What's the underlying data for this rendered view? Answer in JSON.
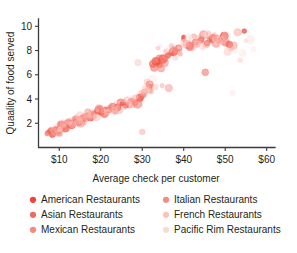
{
  "chart_data": {
    "type": "scatter",
    "title": "",
    "xlabel": "Average check per customer",
    "ylabel": "Quaality of food served",
    "xlim": [
      5,
      62
    ],
    "ylim": [
      0,
      10.6
    ],
    "grid": false,
    "legend_position": "bottom",
    "xticks": [
      10,
      20,
      30,
      40,
      50,
      60
    ],
    "xticklabels": [
      "$10",
      "$20",
      "$30",
      "$40",
      "$50",
      "$60"
    ],
    "yticks": [
      2,
      4,
      6,
      8,
      10
    ],
    "yticklabels": [
      "2",
      "4",
      "6",
      "8",
      "10"
    ],
    "series": [
      {
        "name": "American Restaurants",
        "color": "#f04438",
        "opacity": 0.85,
        "points": [
          [
            7.2,
            1.2
          ],
          [
            7.8,
            1.4
          ],
          [
            8.4,
            1.1
          ],
          [
            9.1,
            1.5
          ],
          [
            9.8,
            1.3
          ],
          [
            10.6,
            1.8
          ],
          [
            11.4,
            1.6
          ],
          [
            12.2,
            2.0
          ],
          [
            13.0,
            1.9
          ],
          [
            13.9,
            2.2
          ],
          [
            14.8,
            2.1
          ],
          [
            15.7,
            2.4
          ],
          [
            16.6,
            2.6
          ],
          [
            17.5,
            2.5
          ],
          [
            18.4,
            2.8
          ],
          [
            19.3,
            3.0
          ],
          [
            20.2,
            2.9
          ],
          [
            21.1,
            3.2
          ],
          [
            22.0,
            3.1
          ],
          [
            23.0,
            3.4
          ],
          [
            24.0,
            3.3
          ],
          [
            25.0,
            3.6
          ],
          [
            26.0,
            3.5
          ],
          [
            27.0,
            3.8
          ],
          [
            28.2,
            3.7
          ],
          [
            29.4,
            4.1
          ],
          [
            30.6,
            4.6
          ],
          [
            31.8,
            5.2
          ],
          [
            32.6,
            6.9
          ],
          [
            33.4,
            7.1
          ],
          [
            34.2,
            6.8
          ],
          [
            35.0,
            7.3
          ],
          [
            36.2,
            7.6
          ],
          [
            37.5,
            7.9
          ],
          [
            38.8,
            8.2
          ],
          [
            40.0,
            9.1
          ],
          [
            41.4,
            8.4
          ],
          [
            42.8,
            8.7
          ],
          [
            44.2,
            8.9
          ],
          [
            45.6,
            8.6
          ],
          [
            47.0,
            9.0
          ],
          [
            48.4,
            8.8
          ],
          [
            49.8,
            9.2
          ],
          [
            51.0,
            8.5
          ],
          [
            54.6,
            9.6
          ]
        ]
      },
      {
        "name": "Asian Restaurants",
        "color": "#f4695e",
        "opacity": 0.7,
        "points": [
          [
            7.5,
            1.3
          ],
          [
            8.2,
            1.0
          ],
          [
            9.0,
            1.4
          ],
          [
            9.9,
            1.2
          ],
          [
            10.9,
            1.7
          ],
          [
            11.9,
            1.9
          ],
          [
            12.9,
            1.8
          ],
          [
            14.0,
            2.3
          ],
          [
            15.1,
            2.0
          ],
          [
            16.2,
            2.5
          ],
          [
            17.3,
            2.7
          ],
          [
            18.5,
            2.6
          ],
          [
            19.7,
            3.1
          ],
          [
            20.9,
            2.8
          ],
          [
            22.2,
            3.3
          ],
          [
            23.5,
            3.0
          ],
          [
            24.8,
            3.7
          ],
          [
            26.1,
            3.4
          ],
          [
            27.5,
            3.9
          ],
          [
            28.9,
            3.6
          ],
          [
            30.3,
            4.3
          ],
          [
            31.7,
            5.0
          ],
          [
            32.9,
            6.6
          ],
          [
            34.1,
            7.4
          ],
          [
            35.3,
            7.0
          ],
          [
            36.8,
            7.8
          ],
          [
            38.3,
            8.0
          ],
          [
            39.9,
            8.9
          ],
          [
            41.5,
            8.3
          ],
          [
            43.1,
            8.6
          ],
          [
            44.8,
            9.3
          ],
          [
            46.5,
            8.9
          ],
          [
            48.2,
            9.1
          ],
          [
            50.0,
            8.7
          ],
          [
            45.2,
            6.2
          ]
        ]
      },
      {
        "name": "Mexican Restaurants",
        "color": "#f6897f",
        "opacity": 0.6,
        "points": [
          [
            7.0,
            1.1
          ],
          [
            8.0,
            1.5
          ],
          [
            9.3,
            1.3
          ],
          [
            10.4,
            1.9
          ],
          [
            11.6,
            1.6
          ],
          [
            12.8,
            2.1
          ],
          [
            14.2,
            2.4
          ],
          [
            15.5,
            2.2
          ],
          [
            16.9,
            2.9
          ],
          [
            18.2,
            2.6
          ],
          [
            19.6,
            3.2
          ],
          [
            21.0,
            2.9
          ],
          [
            22.5,
            3.5
          ],
          [
            24.0,
            3.2
          ],
          [
            25.5,
            3.8
          ],
          [
            27.0,
            3.4
          ],
          [
            28.6,
            4.0
          ],
          [
            30.2,
            4.4
          ],
          [
            31.6,
            4.8
          ],
          [
            33.0,
            7.2
          ],
          [
            34.6,
            6.5
          ],
          [
            36.0,
            7.5
          ],
          [
            37.6,
            8.1
          ],
          [
            39.2,
            7.7
          ],
          [
            40.8,
            8.5
          ],
          [
            42.5,
            9.2
          ],
          [
            44.2,
            8.8
          ],
          [
            46.0,
            9.4
          ],
          [
            47.8,
            8.6
          ],
          [
            49.6,
            9.0
          ],
          [
            34.8,
            5.1
          ],
          [
            36.4,
            4.9
          ],
          [
            52.0,
            8.4
          ]
        ]
      },
      {
        "name": "Italian Restaurants",
        "color": "#f8a49c",
        "opacity": 0.55,
        "points": [
          [
            8.6,
            1.4
          ],
          [
            10.0,
            1.2
          ],
          [
            11.2,
            1.8
          ],
          [
            12.6,
            2.0
          ],
          [
            14.5,
            2.3
          ],
          [
            16.0,
            2.1
          ],
          [
            17.8,
            2.8
          ],
          [
            19.0,
            2.5
          ],
          [
            20.5,
            3.0
          ],
          [
            22.8,
            3.4
          ],
          [
            24.4,
            3.1
          ],
          [
            26.4,
            3.9
          ],
          [
            28.0,
            3.6
          ],
          [
            29.8,
            4.5
          ],
          [
            31.2,
            5.4
          ],
          [
            32.2,
            4.6
          ],
          [
            33.8,
            8.2
          ],
          [
            35.6,
            7.9
          ],
          [
            37.0,
            8.4
          ],
          [
            38.6,
            8.0
          ],
          [
            40.4,
            8.8
          ],
          [
            42.0,
            8.3
          ],
          [
            43.8,
            9.0
          ],
          [
            45.4,
            8.5
          ],
          [
            47.4,
            9.3
          ],
          [
            49.0,
            8.9
          ],
          [
            51.4,
            8.2
          ],
          [
            53.0,
            9.5
          ],
          [
            30.0,
            1.3
          ]
        ]
      },
      {
        "name": "French Restaurants",
        "color": "#fac3bd",
        "opacity": 0.5,
        "points": [
          [
            9.5,
            1.6
          ],
          [
            11.0,
            2.0
          ],
          [
            13.2,
            1.9
          ],
          [
            15.0,
            2.6
          ],
          [
            17.0,
            2.4
          ],
          [
            19.2,
            3.1
          ],
          [
            21.5,
            2.9
          ],
          [
            23.8,
            3.6
          ],
          [
            25.8,
            3.3
          ],
          [
            27.8,
            4.1
          ],
          [
            29.0,
            7.0
          ],
          [
            31.0,
            4.9
          ],
          [
            33.2,
            5.0
          ],
          [
            35.8,
            8.0
          ],
          [
            38.0,
            7.4
          ],
          [
            40.2,
            8.6
          ],
          [
            42.2,
            9.0
          ],
          [
            44.6,
            8.2
          ],
          [
            46.8,
            9.1
          ],
          [
            48.8,
            8.7
          ],
          [
            50.6,
            7.9
          ],
          [
            53.6,
            7.2
          ],
          [
            55.0,
            8.8
          ],
          [
            36.6,
            4.8
          ]
        ]
      },
      {
        "name": "Pacific Rim Restaurants",
        "color": "#fcdedb",
        "opacity": 0.45,
        "points": [
          [
            10.2,
            1.5
          ],
          [
            12.4,
            2.2
          ],
          [
            14.8,
            2.0
          ],
          [
            16.8,
            2.7
          ],
          [
            18.8,
            2.5
          ],
          [
            21.4,
            3.2
          ],
          [
            23.2,
            3.0
          ],
          [
            26.8,
            3.7
          ],
          [
            28.4,
            4.2
          ],
          [
            30.8,
            4.7
          ],
          [
            32.4,
            5.6
          ],
          [
            34.4,
            8.4
          ],
          [
            36.6,
            8.1
          ],
          [
            39.0,
            8.3
          ],
          [
            41.0,
            9.1
          ],
          [
            43.4,
            8.5
          ],
          [
            45.8,
            9.4
          ],
          [
            47.6,
            8.9
          ],
          [
            50.2,
            9.2
          ],
          [
            52.4,
            8.0
          ],
          [
            54.2,
            7.8
          ],
          [
            56.0,
            8.9
          ],
          [
            56.8,
            8.1
          ],
          [
            51.8,
            4.5
          ]
        ]
      }
    ]
  },
  "legend": {
    "entries": [
      {
        "label": "American Restaurants",
        "color": "#f04438"
      },
      {
        "label": "Asian Restaurants",
        "color": "#f4695e"
      },
      {
        "label": "Mexican Restaurants",
        "color": "#f6897f"
      },
      {
        "label": "Italian Restaurants",
        "color": "#f58d86"
      },
      {
        "label": "French Restaurants",
        "color": "#fac3bd"
      },
      {
        "label": "Pacific Rim Restaurants",
        "color": "#fbd9d5"
      }
    ]
  }
}
